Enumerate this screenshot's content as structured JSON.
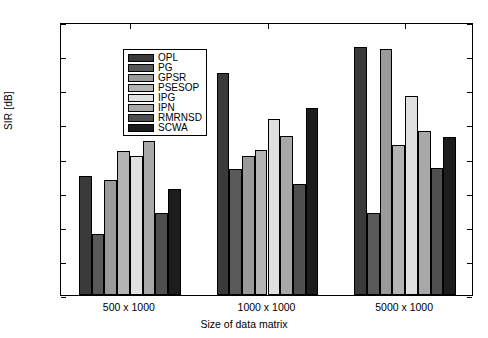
{
  "chart_data": {
    "type": "bar",
    "title": "",
    "xlabel": "Size of data matrix",
    "ylabel": "SIR [dB]",
    "categories": [
      "500 x 1000",
      "1000 x 1000",
      "5000 x 1000"
    ],
    "ylim": [
      0,
      40
    ],
    "yticks": [
      0,
      5,
      10,
      15,
      20,
      25,
      30,
      35,
      40
    ],
    "ytick_labels": [
      "0",
      "5",
      "10",
      "15",
      "20",
      "25",
      "30",
      "35",
      "40"
    ],
    "grid": false,
    "legend_position": "upper left",
    "series": [
      {
        "name": "OPL",
        "color": "#3a3a3a",
        "values": [
          17.4,
          32.5,
          36.3
        ]
      },
      {
        "name": "PG",
        "color": "#595959",
        "values": [
          8.9,
          18.5,
          12.0
        ]
      },
      {
        "name": "GPSR",
        "color": "#9a9a9a",
        "values": [
          16.9,
          20.3,
          36.1
        ]
      },
      {
        "name": "PSESOP",
        "color": "#b4b4b4",
        "values": [
          21.1,
          21.3,
          22.0
        ]
      },
      {
        "name": "IPG",
        "color": "#e0e0e0",
        "values": [
          20.3,
          25.8,
          29.2
        ]
      },
      {
        "name": "IPN",
        "color": "#a8a8a8",
        "values": [
          22.6,
          23.3,
          24.0
        ]
      },
      {
        "name": "RMRNSD",
        "color": "#4f4f4f",
        "values": [
          12.0,
          16.3,
          18.6
        ]
      },
      {
        "name": "SCWA",
        "color": "#1c1c1c",
        "values": [
          15.6,
          27.4,
          23.2
        ]
      }
    ]
  }
}
